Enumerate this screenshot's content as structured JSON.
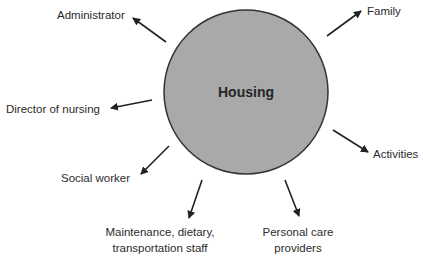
{
  "diagram": {
    "type": "hub-and-spoke",
    "hub": {
      "label": "Housing",
      "fill": "#a9a9a9",
      "stroke": "#333333",
      "cx": 246,
      "cy": 92,
      "r": 82
    },
    "spokes": [
      {
        "label": "Administrator",
        "direction": "outward"
      },
      {
        "label": "Family",
        "direction": "outward"
      },
      {
        "label": "Director of nursing",
        "direction": "outward"
      },
      {
        "label": "Activities",
        "direction": "outward"
      },
      {
        "label": "Social worker",
        "direction": "outward"
      },
      {
        "label": "Maintenance, dietary,",
        "label_line2": "transportation staff",
        "direction": "outward"
      },
      {
        "label": "Personal care",
        "label_line2": "providers",
        "direction": "outward"
      }
    ],
    "arrow_color": "#222222"
  }
}
